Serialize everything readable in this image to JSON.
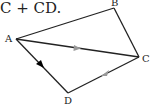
{
  "caption": {
    "part1": "C",
    "plus": " + ",
    "part2": "CD",
    "end": "."
  },
  "diagram": {
    "points": {
      "A": {
        "label": "A",
        "x": 16,
        "y": 39
      },
      "B": {
        "label": "B",
        "x": 114,
        "y": 8
      },
      "C": {
        "label": "C",
        "x": 139,
        "y": 57
      },
      "D": {
        "label": "D",
        "x": 68,
        "y": 93
      }
    },
    "segments": [
      "AB",
      "BC",
      "AC",
      "AD",
      "CD"
    ],
    "arrows": [
      {
        "on": "AD",
        "style": "filled",
        "color": "#000000"
      },
      {
        "on": "AC",
        "style": "light",
        "color": "#999999"
      },
      {
        "on": "CD",
        "style": "light",
        "color": "#999999",
        "direction": "toward D"
      }
    ]
  }
}
